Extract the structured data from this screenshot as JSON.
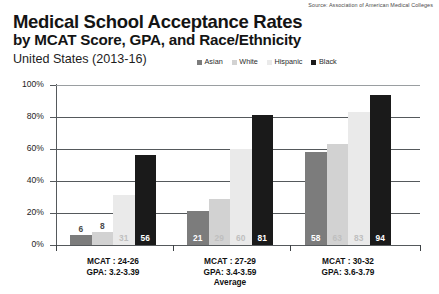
{
  "source": "Source: Association of American Medical Colleges",
  "title": {
    "line1": "Medical School Acceptance Rates",
    "line2": "by MCAT Score, GPA, and Race/Ethnicity",
    "subtitle": "United States (2013-16)"
  },
  "colors": {
    "asian": "#7c7c7c",
    "white": "#d2d2d2",
    "hispanic": "#eaeaea",
    "black": "#1a1a1a",
    "gridline": "#55595c",
    "background": "#ffffff"
  },
  "chart_data": {
    "type": "bar",
    "title": "Medical School Acceptance Rates by MCAT Score, GPA, and Race/Ethnicity",
    "subtitle": "United States (2013-16)",
    "xlabel": "Average",
    "ylabel": "",
    "ylim": [
      0,
      100
    ],
    "yticks": [
      0,
      20,
      40,
      60,
      80,
      100
    ],
    "ytick_labels": [
      "0%",
      "20%",
      "40%",
      "60%",
      "80%",
      "100%"
    ],
    "grid": true,
    "legend_position": "top-right",
    "categories": [
      "MCAT : 24-26\nGPA: 3.2-3.39",
      "MCAT : 27-29\nGPA: 3.4-3.59",
      "MCAT : 30-32\nGPA: 3.6-3.79"
    ],
    "category_lines": [
      [
        "MCAT : 24-26",
        "GPA: 3.2-3.39"
      ],
      [
        "MCAT : 27-29",
        "GPA: 3.4-3.59"
      ],
      [
        "MCAT : 30-32",
        "GPA: 3.6-3.79"
      ]
    ],
    "series": [
      {
        "name": "Asian",
        "color": "#7c7c7c",
        "values": [
          6,
          21,
          58
        ]
      },
      {
        "name": "White",
        "color": "#d2d2d2",
        "values": [
          8,
          29,
          63
        ]
      },
      {
        "name": "Hispanic",
        "color": "#eaeaea",
        "values": [
          31,
          60,
          83
        ]
      },
      {
        "name": "Black",
        "color": "#1a1a1a",
        "values": [
          56,
          81,
          94
        ]
      }
    ]
  }
}
